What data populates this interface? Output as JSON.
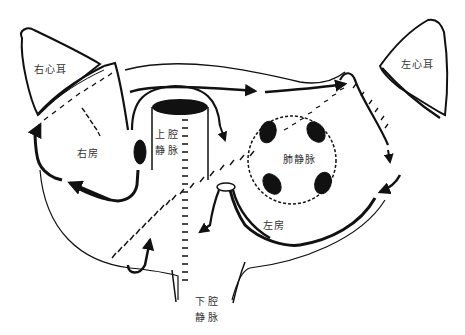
{
  "figure": {
    "type": "anatomical line drawing",
    "colors": {
      "ink": "#111111",
      "background": "#ffffff",
      "label": "#333333"
    }
  },
  "labels": {
    "right_auricle": "右心耳",
    "left_auricle": "左心耳",
    "right_atrium": "右房",
    "svc_line1": "上腔",
    "svc_line2": "静脉",
    "pulmonary_veins": "肺静脉",
    "left_atrium": "左房",
    "ivc_line1": "下腔",
    "ivc_line2": "静脉"
  }
}
